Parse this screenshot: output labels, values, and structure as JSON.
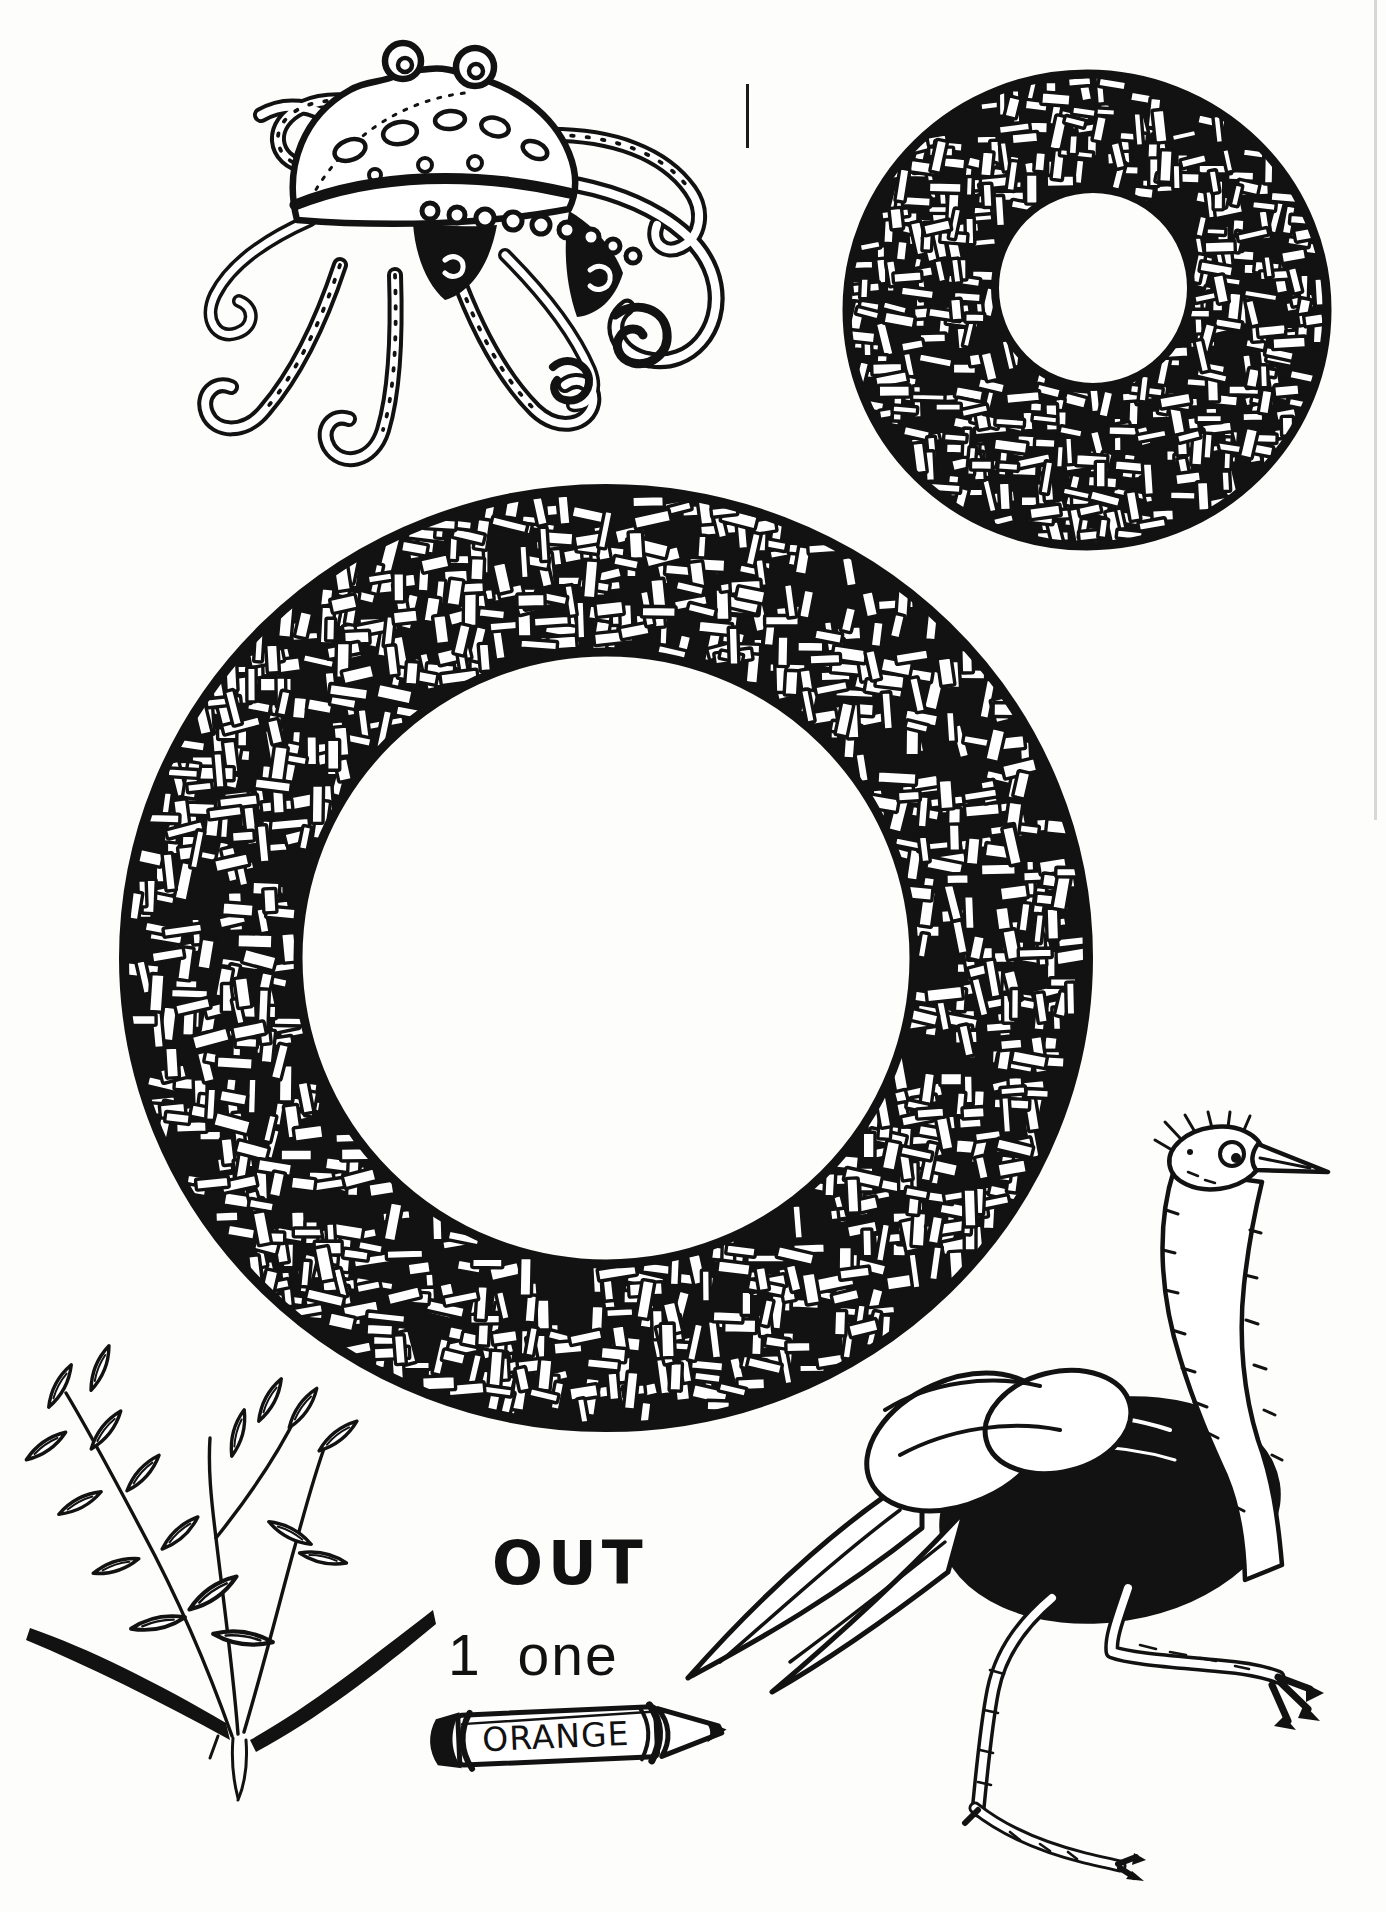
{
  "page": {
    "kind": "alphabet coloring book page",
    "letter_theme": "O",
    "paper_color": "#fdfdfb",
    "ink_color": "#121212"
  },
  "letters": {
    "large": {
      "letter": "O",
      "style": "hand-drawn ring filled with basket-weave hatching"
    },
    "small": {
      "letter": "o",
      "style": "hand-drawn ring filled with basket-weave hatching"
    }
  },
  "texts": {
    "word_out": "OUT",
    "numeral": "1",
    "number_word": "one",
    "crayon_label": "ORANGE"
  },
  "illustrations": [
    {
      "id": "octopus",
      "label": "octopus with curled tentacles"
    },
    {
      "id": "lowercase-o",
      "label": "textured lowercase letter o"
    },
    {
      "id": "uppercase-o",
      "label": "textured uppercase letter O"
    },
    {
      "id": "oats",
      "label": "oat plant sprig with ground strokes"
    },
    {
      "id": "orange-crayon",
      "label": "crayon labelled ORANGE"
    },
    {
      "id": "ostrich",
      "label": "running ostrich with head up"
    }
  ]
}
